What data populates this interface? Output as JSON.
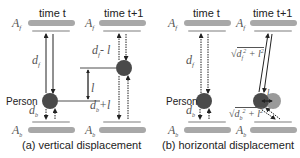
{
  "figure": {
    "panels": [
      {
        "id": "a",
        "caption": "(a) vertical displacement",
        "left_column": {
          "time_label": "time t",
          "front_antenna": "A_f",
          "back_antenna": "A_b",
          "front_distance": "d_f",
          "back_distance": "d_b",
          "person_label": "Person"
        },
        "right_column": {
          "time_label": "time t+1",
          "front_antenna": "A_f",
          "back_antenna": "A_b",
          "front_distance": "d_f - l",
          "back_distance": "d_b + l",
          "displacement": "l"
        }
      },
      {
        "id": "b",
        "caption": "(b) horizontal displacement",
        "left_column": {
          "time_label": "time t",
          "front_antenna": "A_f",
          "back_antenna": "A_b",
          "front_distance": "d_f",
          "back_distance": "d_b",
          "person_label": "Person"
        },
        "right_column": {
          "time_label": "time t+1",
          "front_antenna": "A_f",
          "back_antenna": "A_b",
          "front_distance": "√(d_f² + l²)",
          "back_distance": "√(d_b² + l²)",
          "displacement": "l"
        }
      }
    ],
    "colors": {
      "antenna_bar": "#a8a8a8",
      "antenna_reflection": "#bdbdbd",
      "person": "#4a4a4a",
      "person_moved": "#9a9a9a",
      "arrow": "#222222"
    }
  }
}
